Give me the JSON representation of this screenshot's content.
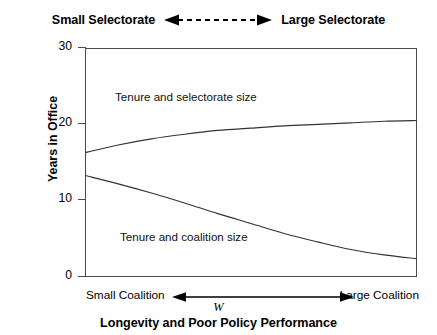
{
  "figure": {
    "caption": "Longevity and Poor Policy Performance",
    "background_color": "#ffffff",
    "axis_color": "#4a4a4a",
    "curve_color": "#333333"
  },
  "top_axis": {
    "left_label": "Small Selectorate",
    "right_label": "Large Selectorate",
    "arrow_style": "dashed-double-headed",
    "arrow_icon": "dashed-double-arrow-icon"
  },
  "bottom_axis": {
    "left_label": "Small Coalition",
    "right_label": "Large Coalition",
    "symbol": "W",
    "arrow_style": "solid-double-headed",
    "arrow_icon": "solid-double-arrow-icon"
  },
  "y_axis": {
    "title": "Years in Office",
    "ticks": [
      "0",
      "10",
      "20",
      "30"
    ]
  },
  "curve_labels": {
    "upper": "Tenure and selectorate size",
    "lower": "Tenure and coalition size"
  },
  "chart_data": {
    "type": "line",
    "title": "Longevity and Poor Policy Performance",
    "xlabel": "W",
    "ylabel": "Years in Office",
    "xlim": [
      0,
      1
    ],
    "ylim": [
      0,
      30
    ],
    "grid": false,
    "legend": "inline-annotations",
    "x_axis_left_label": "Small Coalition",
    "x_axis_right_label": "Large Coalition",
    "top_axis_left_label": "Small Selectorate",
    "top_axis_right_label": "Large Selectorate",
    "yticks": [
      0,
      10,
      20,
      30
    ],
    "series": [
      {
        "name": "Tenure and selectorate size",
        "x": [
          0.0,
          0.1,
          0.2,
          0.3,
          0.4,
          0.5,
          0.6,
          0.7,
          0.8,
          0.9,
          1.0
        ],
        "values": [
          16.3,
          17.3,
          18.1,
          18.7,
          19.2,
          19.5,
          19.8,
          20.0,
          20.2,
          20.4,
          20.5
        ]
      },
      {
        "name": "Tenure and coalition size",
        "x": [
          0.0,
          0.1,
          0.2,
          0.3,
          0.4,
          0.5,
          0.6,
          0.7,
          0.8,
          0.9,
          1.0
        ],
        "values": [
          13.3,
          12.2,
          11.0,
          9.7,
          8.3,
          7.0,
          5.7,
          4.6,
          3.6,
          2.9,
          2.4
        ]
      }
    ]
  }
}
